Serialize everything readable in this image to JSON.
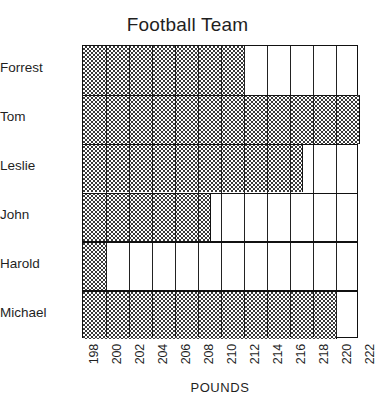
{
  "chart_data": {
    "type": "bar",
    "orientation": "horizontal",
    "title": "Football Team",
    "xlabel": "POUNDS",
    "ylabel": "",
    "categories": [
      "Forrest",
      "Tom",
      "Leslie",
      "John",
      "Harold",
      "Michael"
    ],
    "values": [
      212,
      222,
      217,
      209,
      200,
      220
    ],
    "xlim": [
      198,
      222
    ],
    "xtick_labels": [
      "198",
      "200",
      "202",
      "204",
      "206",
      "208",
      "210",
      "212",
      "214",
      "216",
      "218",
      "220",
      "222"
    ],
    "xtick_values": [
      198,
      200,
      202,
      204,
      206,
      208,
      210,
      212,
      214,
      216,
      218,
      220,
      222
    ],
    "xtick_interval": 2,
    "grid": true,
    "grid_axis": "both",
    "legend": false,
    "bar_fill": "checkered-hatch",
    "bar_color": "#3a3a3a",
    "grid_color": "#222222",
    "background_color": "#ffffff",
    "text_color": "#1f1f1f"
  }
}
